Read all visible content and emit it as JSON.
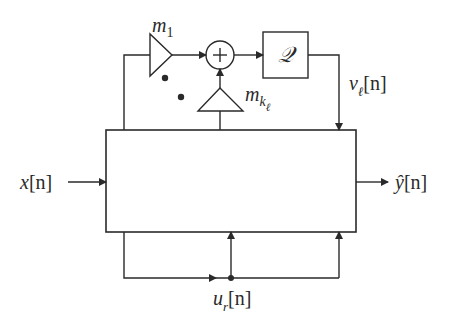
{
  "diagram": {
    "colors": {
      "stroke": "#2a2a2a",
      "background": "#ffffff"
    },
    "nodes": {
      "main_block": {
        "label": ""
      },
      "multiplier_1": {
        "base": "m",
        "sub": "1"
      },
      "multiplier_k": {
        "base": "m",
        "sub": "k",
        "subsub": "ℓ"
      },
      "adder": {
        "symbol": "+"
      },
      "quantizer": {
        "label": "𝒬"
      }
    },
    "signals": {
      "input": {
        "base": "x",
        "arg": "[n]"
      },
      "output": {
        "base": "ŷ",
        "arg": "[n]"
      },
      "quantized": {
        "base": "v",
        "sub": "ℓ",
        "arg": "[n]"
      },
      "feedback": {
        "base": "u",
        "sub": "r",
        "arg": "[n]"
      }
    },
    "ellipsis_dots": 2
  }
}
